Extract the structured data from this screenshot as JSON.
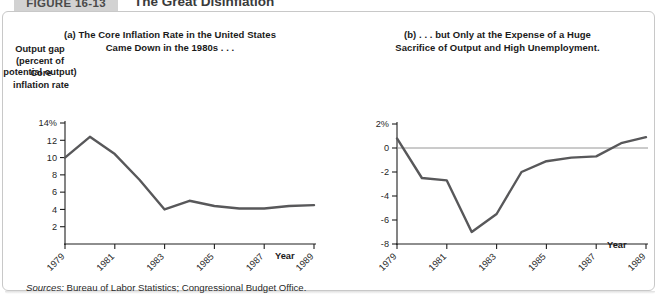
{
  "header": {
    "badge": "FIGURE 16-13",
    "title": "The Great Disinflation"
  },
  "sources": {
    "label": "Sources:",
    "text": " Bureau of Labor Statistics; Congressional Budget Office."
  },
  "panel_a": {
    "subtitle_line1": "(a) The Core Inflation Rate in the United States",
    "subtitle_line2": "Came Down in the 1980s . . .",
    "ylabel_line1": "Core",
    "ylabel_line2": "inflation",
    "ylabel_line3": "rate",
    "xlabel": "Year"
  },
  "panel_b": {
    "subtitle_line1": "(b) . . . but Only at the Expense of a Huge",
    "subtitle_line2": "Sacrifice of Output and High Unemployment.",
    "ylabel_line1": "Output gap",
    "ylabel_line2": "(percent of",
    "ylabel_line3": "potential",
    "ylabel_line4": "output)",
    "xlabel": "Year"
  },
  "colors": {
    "line": "#58585a",
    "axis": "#1f1f1f",
    "zero_line": "#8a8a8a",
    "badge_bg": "#d2d2d2",
    "panel_border": "#c8c8c8"
  },
  "chart_data": [
    {
      "type": "line",
      "title": "(a) The Core Inflation Rate in the United States Came Down in the 1980s . . .",
      "xlabel": "Year",
      "ylabel": "Core inflation rate",
      "ylim": [
        0,
        14
      ],
      "xlim": [
        1979,
        1989
      ],
      "grid": false,
      "legend": "none",
      "ytick_labels": [
        "14%",
        "12",
        "10",
        "8",
        "6",
        "4",
        "2"
      ],
      "ytick_values": [
        14,
        12,
        10,
        8,
        6,
        4,
        2
      ],
      "xtick_labels": [
        "1979",
        "1981",
        "1983",
        "1985",
        "1987",
        "1989"
      ],
      "xtick_values": [
        1979,
        1981,
        1983,
        1985,
        1987,
        1989
      ],
      "series": [
        {
          "name": "Core inflation rate",
          "x": [
            1979,
            1980,
            1981,
            1982,
            1983,
            1984,
            1985,
            1986,
            1987,
            1988,
            1989
          ],
          "values": [
            10.0,
            12.4,
            10.4,
            7.4,
            4.0,
            5.0,
            4.4,
            4.1,
            4.1,
            4.4,
            4.5
          ]
        }
      ]
    },
    {
      "type": "line",
      "title": "(b) . . . but Only at the Expense of a Huge Sacrifice of Output and High Unemployment.",
      "xlabel": "Year",
      "ylabel": "Output gap (percent of potential output)",
      "ylim": [
        -8,
        2
      ],
      "xlim": [
        1979,
        1989
      ],
      "grid": false,
      "legend": "none",
      "zero_reference_line": 0,
      "ytick_labels": [
        "2%",
        "0",
        "-2",
        "-4",
        "-6",
        "-8"
      ],
      "ytick_values": [
        2,
        0,
        -2,
        -4,
        -6,
        -8
      ],
      "xtick_labels": [
        "1979",
        "1981",
        "1983",
        "1985",
        "1987",
        "1989"
      ],
      "xtick_values": [
        1979,
        1981,
        1983,
        1985,
        1987,
        1989
      ],
      "series": [
        {
          "name": "Output gap",
          "x": [
            1979,
            1980,
            1981,
            1982,
            1983,
            1984,
            1985,
            1986,
            1987,
            1988,
            1989
          ],
          "values": [
            0.8,
            -2.5,
            -2.7,
            -7.0,
            -5.5,
            -2.0,
            -1.1,
            -0.8,
            -0.7,
            0.4,
            0.9
          ]
        }
      ]
    }
  ]
}
